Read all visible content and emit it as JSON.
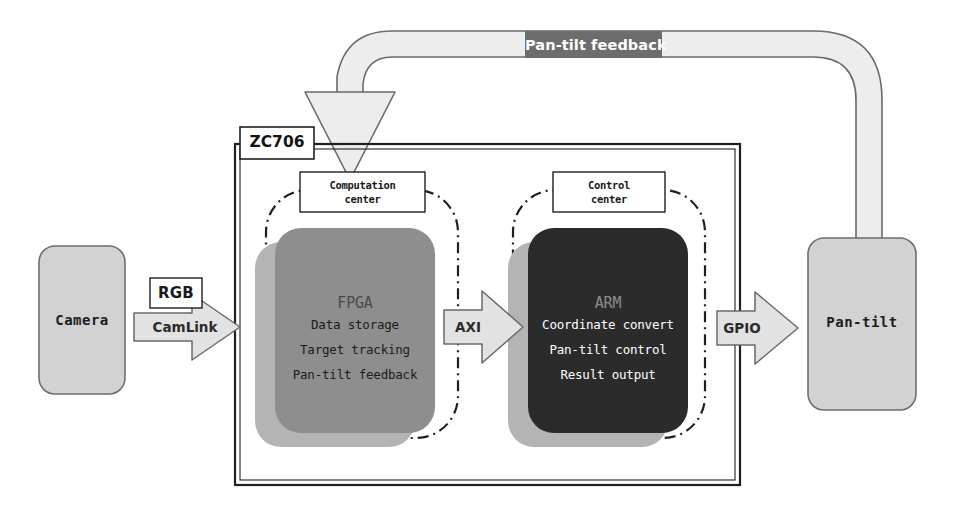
{
  "diagram": {
    "board": {
      "tag_label": "ZC706"
    },
    "feedback": {
      "banner_label": "Pan-tilt feedback"
    },
    "endpoints": {
      "camera": {
        "label": "Camera"
      },
      "pantilt": {
        "label": "Pan-tilt"
      }
    },
    "interfaces": {
      "rgb": {
        "label": "RGB"
      },
      "camlink": {
        "label": "CamLink"
      },
      "axi": {
        "label": "AXI"
      },
      "gpio": {
        "label": "GPIO"
      }
    },
    "regions": [
      {
        "id": "computation-center",
        "label_line1": "Computation",
        "label_line2": "center"
      },
      {
        "id": "control-center",
        "label_line1": "Control",
        "label_line2": "center"
      }
    ],
    "blocks": [
      {
        "id": "fpga",
        "title": "FPGA",
        "items": [
          "Data storage",
          "Target tracking",
          "Pan-tilt feedback"
        ]
      },
      {
        "id": "arm",
        "title": "ARM",
        "items": [
          "Coordinate convert",
          "Pan-tilt control",
          "Result output"
        ]
      }
    ],
    "colors": {
      "page_background": "#ffffff",
      "fpga_fill": "#8e8e8e",
      "fpga_shadow": "#b4b4b4",
      "arm_fill": "#2b2b2b",
      "arm_shadow": "#b4b4b4",
      "endpoint_fill": "#d2d2d2",
      "endpoint_stroke": "#6e6e6e",
      "arrow_fill": "#e2e2e2",
      "arrow_stroke": "#6a6a6a",
      "feedback_fill": "#ededed",
      "feedback_stroke": "#6a6a6a",
      "feedback_banner_fill": "#6d6d6d",
      "board_stroke": "#1f1f1f",
      "region_stroke": "#1f1f1f",
      "label_box_fill": "#ffffff",
      "label_box_stroke": "#1f1f1f"
    }
  }
}
